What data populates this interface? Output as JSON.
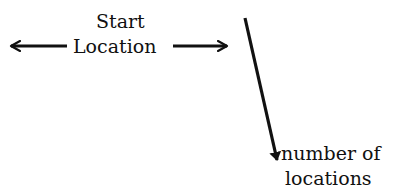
{
  "diagram": {
    "start_label": {
      "line1": "Start",
      "line2": "Location"
    },
    "left_arrow": {
      "direction": "left",
      "icon": "arrow-left-icon"
    },
    "right_arrow": {
      "direction": "right",
      "icon": "arrow-right-icon"
    },
    "down_arrow": {
      "direction": "down-diagonal",
      "icon": "arrow-down-icon"
    },
    "end_label": {
      "line1": "number of",
      "line2": "locations"
    },
    "colors": {
      "ink": "#111111",
      "background": "#ffffff"
    }
  }
}
